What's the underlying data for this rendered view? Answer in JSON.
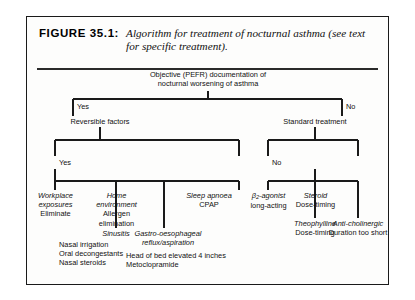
{
  "figure": {
    "label": "FIGURE 35.1:",
    "caption": "Algorithm for treatment of nocturnal asthma (see text for specific treatment)."
  },
  "flow": {
    "root": {
      "line1": "Objective (PEFR) documentation of",
      "line2": "nocturnal worsening of asthma"
    },
    "level1": {
      "yes_label": "Yes",
      "no_label": "No",
      "yes_node": "Reversible factors",
      "no_node": "Standard treatment"
    },
    "level2": {
      "yes_label": "Yes",
      "no_label": "No"
    },
    "reversible_branches": [
      {
        "title": "Workplace",
        "title2": "exposures",
        "detail": "Eliminate"
      },
      {
        "title": "Home",
        "title2": "environment",
        "detail": "Allergen",
        "detail2": "elimination"
      },
      {
        "title": "Sleep apnoea",
        "title2": "",
        "detail": "CPAP"
      }
    ],
    "reversible_lower": [
      {
        "title": "Sinusitis",
        "details": [
          "Nasal irrigation",
          "Oral decongestants",
          "Nasal steroids"
        ]
      },
      {
        "title": "Gastro-oesophageal",
        "title2": "reflux/aspiration",
        "details": [
          "Head of bed elevated 4 inches",
          "Metoclopramide"
        ]
      }
    ],
    "standard_branches": [
      {
        "title": "β",
        "sub": "2",
        "title_rest": "-agonist",
        "detail": "long-acting"
      },
      {
        "title": "Steroid",
        "detail": "Dose-timing"
      }
    ],
    "standard_lower": [
      {
        "title": "Theophylline",
        "detail": "Dose-timing"
      },
      {
        "title": "Anti-cholinergic",
        "detail": "Duration too short"
      }
    ]
  },
  "colors": {
    "line": "#1a1a1a",
    "border": "#1a1a1a",
    "background": "#fdfdfc"
  }
}
